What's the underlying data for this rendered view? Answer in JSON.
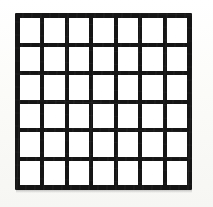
{
  "figure": {
    "type": "rectangular-grid",
    "columns": 7,
    "rows": 6,
    "cell_count": 42,
    "line_color": "#151515",
    "cell_color": "#ffffff",
    "background_color": "#fcfcfa",
    "line_thickness_px": 4,
    "border_thickness_px": 5,
    "cell_width_px": 21,
    "cell_height_px": 25,
    "figure_left_px": 15,
    "figure_top_px": 13,
    "figure_width_px": 177,
    "figure_height_px": 177,
    "caption": ""
  }
}
